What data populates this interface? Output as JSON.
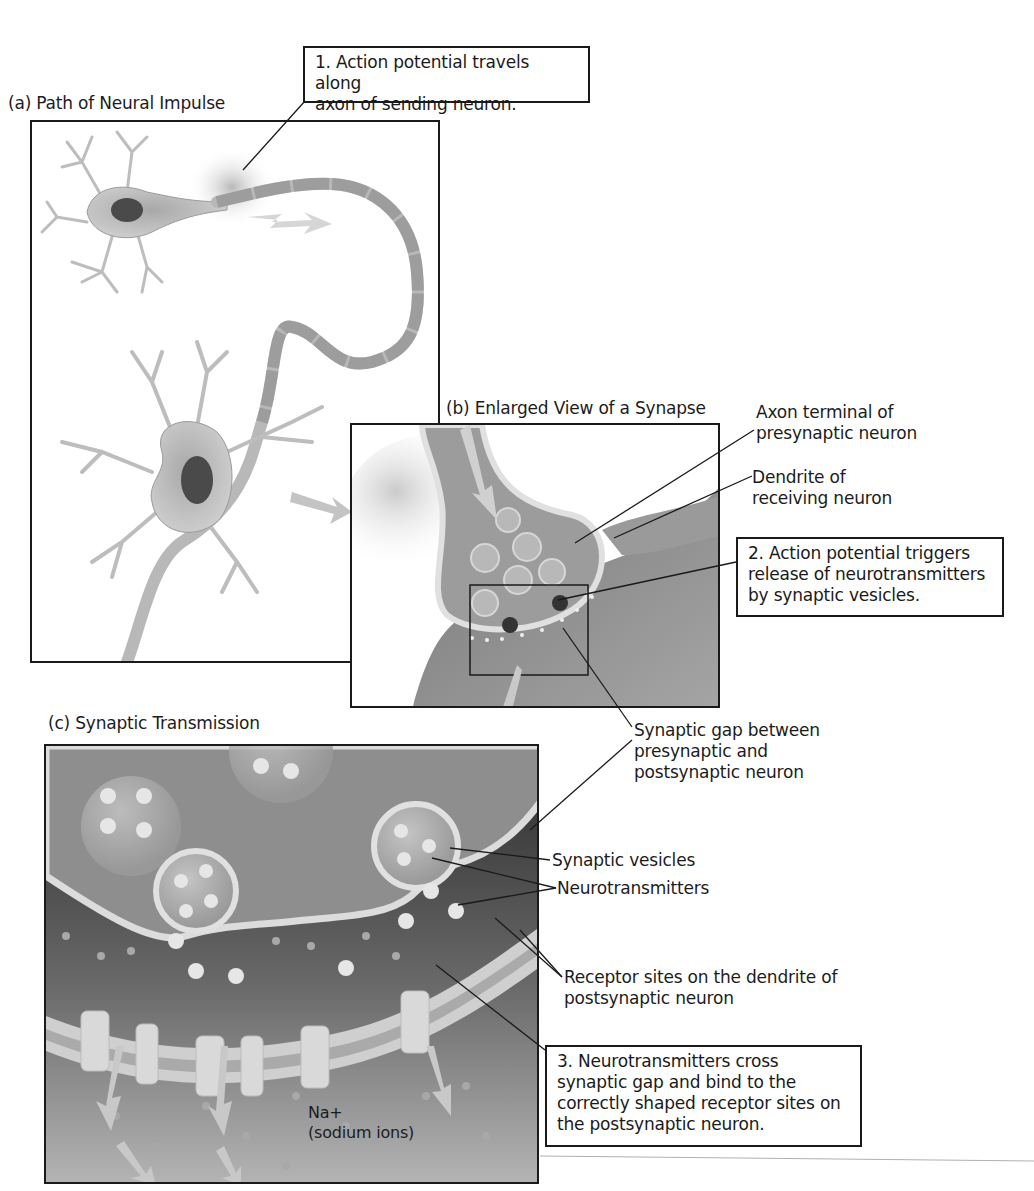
{
  "figure": {
    "panels": [
      {
        "id": "a",
        "title": "(a) Path of Neural Impulse"
      },
      {
        "id": "b",
        "title": "(b) Enlarged View of a Synapse"
      },
      {
        "id": "c",
        "title": "(c) Synaptic Transmission"
      }
    ],
    "callouts": [
      {
        "step": "1",
        "text": "1. Action potential travels along\naxon of sending neuron."
      },
      {
        "step": "2",
        "text": "2. Action potential triggers\nrelease of neurotransmitters\nby synaptic vesicles."
      },
      {
        "step": "3",
        "text": "3. Neurotransmitters cross\nsynaptic gap and bind to the\ncorrectly shaped receptor sites on\nthe postsynaptic neuron."
      }
    ],
    "labels": {
      "axon_terminal": "Axon terminal of\npresynaptic neuron",
      "dendrite": "Dendrite of\nreceiving neuron",
      "synaptic_gap": "Synaptic gap between\npresynaptic and\npostsynaptic neuron",
      "synaptic_vesicles": "Synaptic vesicles",
      "neurotransmitters": "Neurotransmitters",
      "receptor_sites": "Receptor sites on the dendrite of\npostsynaptic neuron",
      "sodium_ions": "Na+\n(sodium ions)"
    },
    "colors": {
      "ink": "#1a1a1a",
      "neuron_fill": "#bdbdbd",
      "neuron_dark": "#8a8a8a",
      "nucleus": "#4a4a4a",
      "myelin": "#c9c9c9",
      "cleft_dark": "#141414",
      "terminal_fill": "#9e9e9e",
      "background_gradient_top": "#8c8c8c",
      "background_gradient_bottom": "#b5b5b5",
      "membrane": "#dcdcdc"
    }
  }
}
